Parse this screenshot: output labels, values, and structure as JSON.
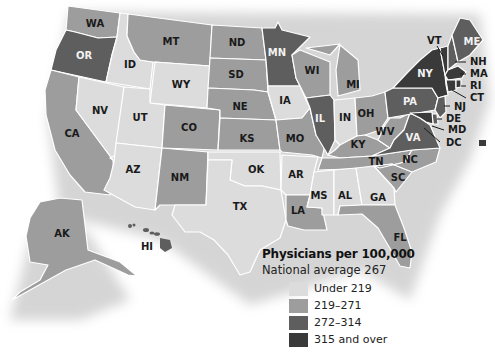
{
  "legend": {
    "title": "Physicians per 100,000",
    "subtitle": "National average 267",
    "classes": [
      {
        "label": "Under 219",
        "color": "#dcdcdc"
      },
      {
        "label": "219–271",
        "color": "#9d9d9d"
      },
      {
        "label": "272–314",
        "color": "#5e5e5e"
      },
      {
        "label": "315 and over",
        "color": "#3a3a3a"
      }
    ]
  },
  "national_average": 267,
  "states": [
    {
      "abbr": "WA",
      "class": 1
    },
    {
      "abbr": "OR",
      "class": 2
    },
    {
      "abbr": "CA",
      "class": 1
    },
    {
      "abbr": "ID",
      "class": 0
    },
    {
      "abbr": "NV",
      "class": 0
    },
    {
      "abbr": "MT",
      "class": 1
    },
    {
      "abbr": "WY",
      "class": 0
    },
    {
      "abbr": "UT",
      "class": 0
    },
    {
      "abbr": "AZ",
      "class": 0
    },
    {
      "abbr": "CO",
      "class": 1
    },
    {
      "abbr": "NM",
      "class": 1
    },
    {
      "abbr": "ND",
      "class": 1
    },
    {
      "abbr": "SD",
      "class": 1
    },
    {
      "abbr": "NE",
      "class": 1
    },
    {
      "abbr": "KS",
      "class": 1
    },
    {
      "abbr": "OK",
      "class": 0
    },
    {
      "abbr": "TX",
      "class": 0
    },
    {
      "abbr": "MN",
      "class": 2
    },
    {
      "abbr": "IA",
      "class": 0
    },
    {
      "abbr": "MO",
      "class": 1
    },
    {
      "abbr": "AR",
      "class": 0
    },
    {
      "abbr": "LA",
      "class": 1
    },
    {
      "abbr": "WI",
      "class": 1
    },
    {
      "abbr": "IL",
      "class": 2
    },
    {
      "abbr": "MI",
      "class": 1
    },
    {
      "abbr": "IN",
      "class": 0
    },
    {
      "abbr": "OH",
      "class": 1
    },
    {
      "abbr": "KY",
      "class": 1
    },
    {
      "abbr": "TN",
      "class": 1
    },
    {
      "abbr": "MS",
      "class": 0
    },
    {
      "abbr": "AL",
      "class": 0
    },
    {
      "abbr": "GA",
      "class": 0
    },
    {
      "abbr": "FL",
      "class": 1
    },
    {
      "abbr": "SC",
      "class": 1
    },
    {
      "abbr": "NC",
      "class": 1
    },
    {
      "abbr": "WV",
      "class": 1
    },
    {
      "abbr": "VA",
      "class": 2
    },
    {
      "abbr": "PA",
      "class": 2
    },
    {
      "abbr": "NY",
      "class": 3
    },
    {
      "abbr": "VT",
      "class": 3
    },
    {
      "abbr": "NH",
      "class": 2
    },
    {
      "abbr": "ME",
      "class": 2
    },
    {
      "abbr": "MA",
      "class": 3
    },
    {
      "abbr": "RI",
      "class": 3
    },
    {
      "abbr": "CT",
      "class": 3
    },
    {
      "abbr": "NJ",
      "class": 2
    },
    {
      "abbr": "DE",
      "class": 2
    },
    {
      "abbr": "MD",
      "class": 3
    },
    {
      "abbr": "DC",
      "class": 3
    },
    {
      "abbr": "AK",
      "class": 1
    },
    {
      "abbr": "HI",
      "class": 2
    }
  ],
  "labels": {
    "WA": "WA",
    "OR": "OR",
    "CA": "CA",
    "ID": "ID",
    "NV": "NV",
    "MT": "MT",
    "WY": "WY",
    "UT": "UT",
    "AZ": "AZ",
    "CO": "CO",
    "NM": "NM",
    "ND": "ND",
    "SD": "SD",
    "NE": "NE",
    "KS": "KS",
    "OK": "OK",
    "TX": "TX",
    "MN": "MN",
    "IA": "IA",
    "MO": "MO",
    "AR": "AR",
    "LA": "LA",
    "WI": "WI",
    "IL": "IL",
    "MI": "MI",
    "IN": "IN",
    "OH": "OH",
    "KY": "KY",
    "TN": "TN",
    "MS": "MS",
    "AL": "AL",
    "GA": "GA",
    "FL": "FL",
    "SC": "SC",
    "NC": "NC",
    "WV": "WV",
    "VA": "VA",
    "PA": "PA",
    "NY": "NY",
    "VT": "VT",
    "NH": "NH",
    "ME": "ME",
    "MA": "MA",
    "RI": "RI",
    "CT": "CT",
    "NJ": "NJ",
    "DE": "DE",
    "MD": "MD",
    "DC": "DC",
    "AK": "AK",
    "HI": "HI"
  }
}
